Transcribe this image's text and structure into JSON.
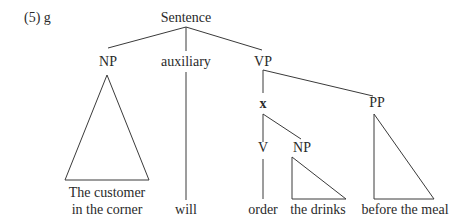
{
  "example_label": "(5) g",
  "tree": {
    "root": "Sentence",
    "nodes": {
      "np_subject": "NP",
      "auxiliary": "auxiliary",
      "vp": "VP",
      "x": "x",
      "pp": "PP",
      "v": "V",
      "np_object": "NP"
    },
    "leaves": {
      "subject_line1": "The customer",
      "subject_line2": "in the corner",
      "aux": "will",
      "verb": "order",
      "object": "the drinks",
      "pp": "before the meal"
    },
    "structure": "[Sentence [NP The customer in the corner] [auxiliary will] [VP [x [V order] [NP the drinks]] [PP before the meal]]]"
  },
  "colors": {
    "background": "#ffffff",
    "ink": "#2a2a2a"
  }
}
